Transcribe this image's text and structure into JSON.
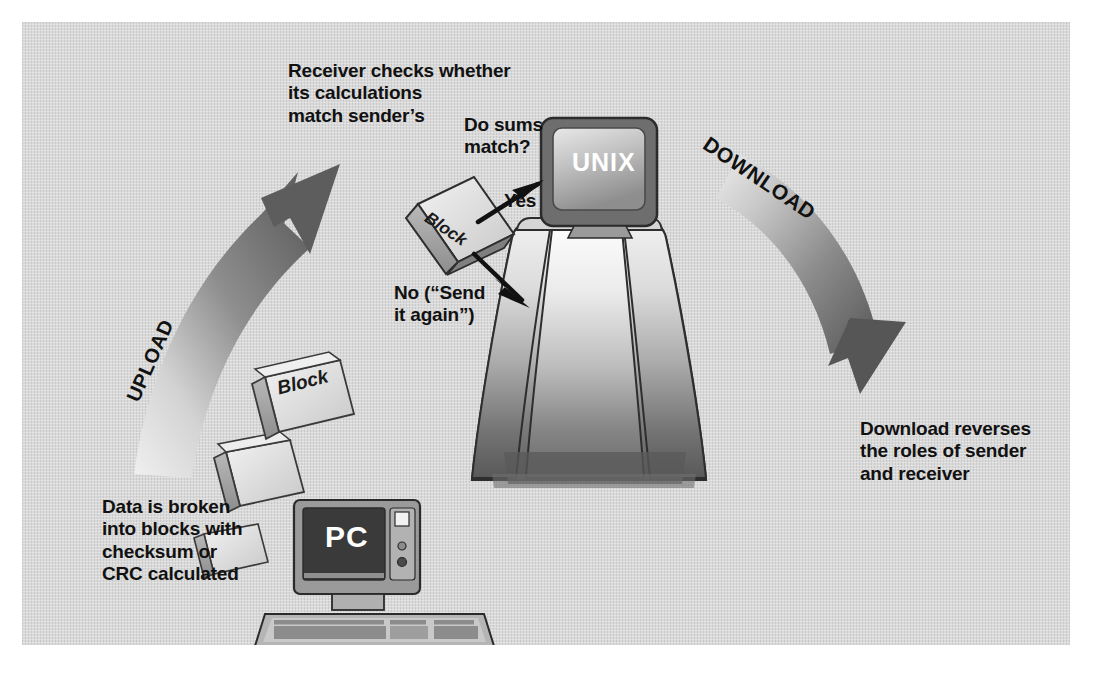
{
  "figure": {
    "background_color": "#d9d9d9",
    "frame_color": "#ffffff",
    "ink_color": "#111111"
  },
  "labels": {
    "receiver_checks": "Receiver checks whether\nits calculations\nmatch sender’s",
    "do_sums_match": "Do sums\nmatch?",
    "yes": "Yes",
    "no_send_again": "No (“Send\nit again”)",
    "data_broken": "Data is broken\ninto blocks with\nchecksum or\nCRC calculated",
    "download_reverses": "Download reverses\nthe roles of sender\nand receiver"
  },
  "arrows": {
    "upload_label": "UPLOAD",
    "download_label": "DOWNLOAD",
    "arrow_color_dark": "#5a5a5a",
    "arrow_color_light": "#e6e6e6",
    "thin_arrow_color": "#111111"
  },
  "computers": {
    "unix": {
      "screen_text": "UNIX",
      "case_color": "#6e6e6e",
      "screen_color_top": "#d6d6d6",
      "screen_color_bottom": "#8c8c8c"
    },
    "pc": {
      "screen_text": "PC",
      "case_color": "#9a9a9a",
      "screen_color": "#3a3a3a"
    }
  },
  "blocks": {
    "upload_block_label": "Block",
    "check_block_label": "Block",
    "face_color_light": "#d8d8d8",
    "face_color_mid": "#bdbdbd",
    "face_color_dark": "#8f8f8f"
  }
}
